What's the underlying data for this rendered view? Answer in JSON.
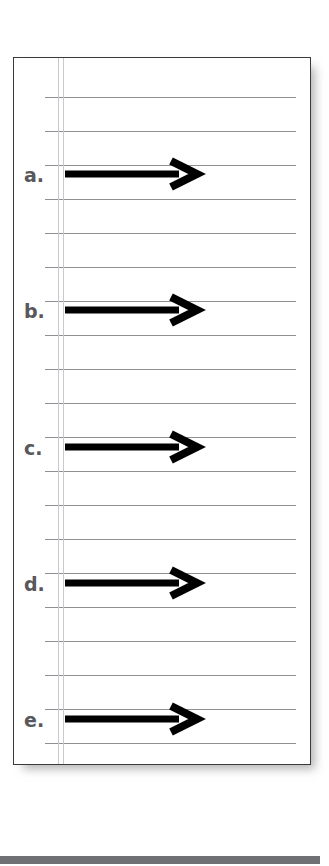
{
  "page": {
    "type": "worksheet-lined-paper",
    "width": 329,
    "height": 866,
    "background_color": "#ffffff"
  },
  "paper": {
    "border_color": "#3a3a3a",
    "fill_color": "#ffffff",
    "rule_color": "#8e8e93",
    "margin_rule_color": "#c9c9cd",
    "rule_count": 20,
    "rule_spacing_px": 34,
    "first_rule_y": 39,
    "margin_rule_x": [
      44,
      49
    ]
  },
  "rows": [
    {
      "label": "a.",
      "label_y": 108,
      "arrow_y": 116
    },
    {
      "label": "b.",
      "label_y": 244,
      "arrow_y": 252
    },
    {
      "label": "c.",
      "label_y": 381,
      "arrow_y": 389
    },
    {
      "label": "d.",
      "label_y": 517,
      "arrow_y": 525
    },
    {
      "label": "e.",
      "label_y": 653,
      "arrow_y": 661
    }
  ],
  "arrow": {
    "icon": "right-arrow-icon",
    "color": "#000000",
    "shaft_length_px": 110,
    "shaft_thickness_px": 7,
    "head_width_px": 22,
    "head_height_px": 26,
    "start_x": 51,
    "end_x": 190
  },
  "bottom_bar": {
    "color": "#6f7074",
    "y": 856,
    "height": 8,
    "width": 320
  }
}
